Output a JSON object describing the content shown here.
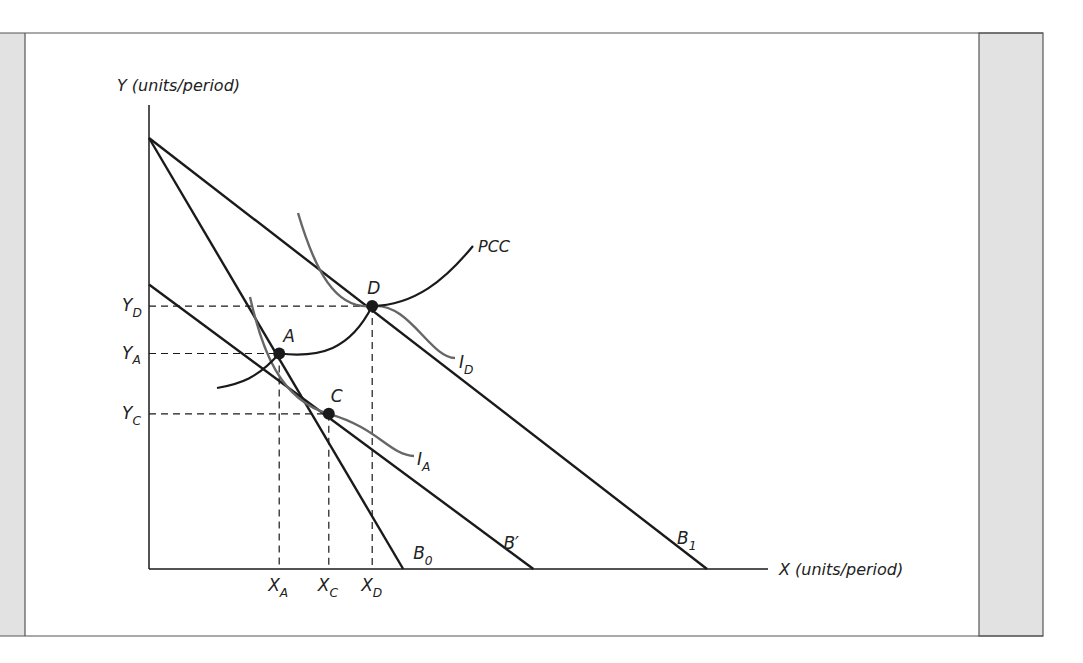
{
  "figure": {
    "y_axis_label": "Y (units/period)",
    "x_axis_label": "X (units/period)",
    "budget_lines": [
      {
        "id": "B0",
        "label": "B",
        "sub": "0",
        "x_intercept": 0.41,
        "y_intercept": 1.0
      },
      {
        "id": "B1",
        "label": "B",
        "sub": "1",
        "x_intercept": 0.9,
        "y_intercept": 1.0
      },
      {
        "id": "Bprime",
        "label": "B′",
        "sub": "",
        "x_intercept": 0.62,
        "y_intercept": 0.66
      }
    ],
    "points": [
      {
        "id": "A",
        "label": "A",
        "x": 0.21,
        "y": 0.5
      },
      {
        "id": "C",
        "label": "C",
        "x": 0.29,
        "y": 0.36
      },
      {
        "id": "D",
        "label": "D",
        "x": 0.36,
        "y": 0.61
      }
    ],
    "indifference_curves": [
      {
        "id": "IA",
        "label": "I",
        "sub": "A"
      },
      {
        "id": "ID",
        "label": "I",
        "sub": "D"
      }
    ],
    "pcc_label": "PCC",
    "x_ticks": [
      {
        "label": "X",
        "sub": "A",
        "x": 0.21
      },
      {
        "label": "X",
        "sub": "C",
        "x": 0.29
      },
      {
        "label": "X",
        "sub": "D",
        "x": 0.36
      }
    ],
    "y_ticks": [
      {
        "label": "Y",
        "sub": "D",
        "y": 0.61
      },
      {
        "label": "Y",
        "sub": "A",
        "y": 0.5
      },
      {
        "label": "Y",
        "sub": "C",
        "y": 0.36
      }
    ],
    "colors": {
      "ink": "#1a1a1a",
      "curve": "#666666",
      "panel": "#e2e2e2",
      "frame": "#555555"
    }
  }
}
